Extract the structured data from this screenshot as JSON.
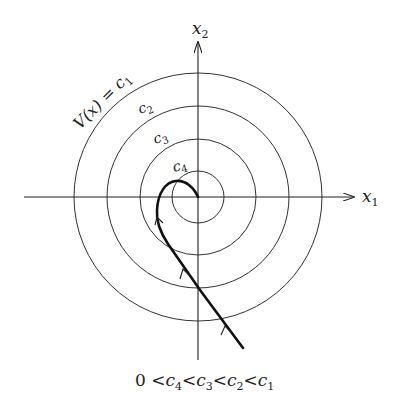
{
  "figure": {
    "axes": {
      "x_label": "x",
      "x_sub": "1",
      "y_label": "x",
      "y_sub": "2"
    },
    "level_curve_label": "V(x) = c",
    "level_curve_label_sub": "1",
    "circle_labels": [
      {
        "text": "c",
        "sub": "2"
      },
      {
        "text": "c",
        "sub": "3"
      },
      {
        "text": "c",
        "sub": "4"
      }
    ],
    "caption": {
      "parts": [
        "0 <",
        "c",
        "4",
        "<",
        "c",
        "3",
        "<",
        "c",
        "2",
        "<",
        "c",
        "1"
      ]
    },
    "caption_text": "0 < c4 < c3 < c2 < c1",
    "colors": {
      "line": "#222222",
      "circle": "#333333",
      "background": "#ffffff"
    }
  }
}
